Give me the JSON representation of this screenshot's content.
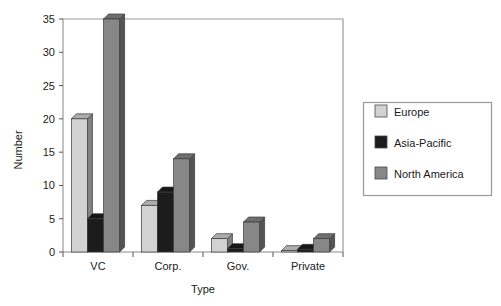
{
  "chart_data": {
    "type": "bar",
    "title": "",
    "xlabel": "Type",
    "ylabel": "Number",
    "categories": [
      "VC",
      "Corp.",
      "Gov.",
      "Private"
    ],
    "series": [
      {
        "name": "Europe",
        "color": "#d2d2d2",
        "values": [
          20,
          7,
          2,
          0.2
        ]
      },
      {
        "name": "Asia-Pacific",
        "color": "#1c1c1c",
        "values": [
          5,
          9,
          0.5,
          0.4
        ]
      },
      {
        "name": "North America",
        "color": "#878787",
        "values": [
          35,
          14,
          4.5,
          2
        ]
      }
    ],
    "ylim": [
      0,
      35
    ],
    "yticks": [
      0,
      5,
      10,
      15,
      20,
      25,
      30,
      35
    ],
    "ytick_labels": [
      "0",
      "5",
      "10",
      "15",
      "20",
      "25",
      "30",
      "35"
    ],
    "grid": false,
    "legend_position": "right",
    "style": "3d-bars"
  },
  "legend": {
    "entries": [
      {
        "label": "Europe",
        "swatch": "#d2d2d2"
      },
      {
        "label": "Asia-Pacific",
        "swatch": "#1c1c1c"
      },
      {
        "label": "North America",
        "swatch": "#878787"
      }
    ]
  },
  "axes": {
    "y_title": "Number",
    "x_title": "Type"
  }
}
